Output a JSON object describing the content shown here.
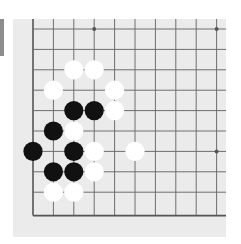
{
  "game": "go",
  "view": "partial board, bottom-left corner",
  "colors": {
    "board_bg": "#ebebeb",
    "grid_line": "#6e6e6e",
    "edge_line": "#555555",
    "black_stone": "#111111",
    "white_stone": "#ffffff",
    "side_tab": "#8c8c8c"
  },
  "grid": {
    "origin_x": 20,
    "origin_y": 10,
    "spacing": 20.4,
    "cols": 10,
    "rows": 10,
    "left_edge": true,
    "bottom_edge": true,
    "top_edge": false,
    "right_edge": false
  },
  "star_points": [
    {
      "col": 3,
      "row": 0
    },
    {
      "col": 9,
      "row": 0
    },
    {
      "col": 3,
      "row": 6
    },
    {
      "col": 9,
      "row": 6
    }
  ],
  "stones": [
    {
      "color": "white",
      "col": 2,
      "row": 2
    },
    {
      "color": "white",
      "col": 3,
      "row": 2
    },
    {
      "color": "white",
      "col": 1,
      "row": 3
    },
    {
      "color": "white",
      "col": 4,
      "row": 3
    },
    {
      "color": "black",
      "col": 2,
      "row": 4
    },
    {
      "color": "black",
      "col": 3,
      "row": 4
    },
    {
      "color": "white",
      "col": 4,
      "row": 4
    },
    {
      "color": "black",
      "col": 1,
      "row": 5
    },
    {
      "color": "white",
      "col": 2,
      "row": 5
    },
    {
      "color": "black",
      "col": 0,
      "row": 6
    },
    {
      "color": "black",
      "col": 2,
      "row": 6
    },
    {
      "color": "white",
      "col": 3,
      "row": 6
    },
    {
      "color": "white",
      "col": 5,
      "row": 6
    },
    {
      "color": "black",
      "col": 1,
      "row": 7
    },
    {
      "color": "black",
      "col": 2,
      "row": 7
    },
    {
      "color": "white",
      "col": 3,
      "row": 7
    },
    {
      "color": "white",
      "col": 1,
      "row": 8
    },
    {
      "color": "white",
      "col": 2,
      "row": 8
    }
  ]
}
